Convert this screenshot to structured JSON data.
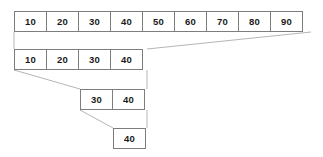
{
  "diagram": {
    "colors": {
      "border": "#7d7d7d",
      "cell_background": "#ffffff",
      "text": "#1a1a1a",
      "connector": "#b5b5b5",
      "page_background": "#ffffff"
    },
    "geometry": {
      "cell_width": 33,
      "cell_height": 21,
      "left_origin_x": 14,
      "right_edge_x": 147
    },
    "rows": [
      {
        "id": "row-1",
        "label": "full-array",
        "x": 14,
        "y": 11,
        "values": [
          "10",
          "20",
          "30",
          "40",
          "50",
          "60",
          "70",
          "80",
          "90"
        ]
      },
      {
        "id": "row-2",
        "label": "first-half",
        "x": 14,
        "y": 49,
        "values": [
          "10",
          "20",
          "30",
          "40"
        ]
      },
      {
        "id": "row-3",
        "label": "second-quarter",
        "x": 80,
        "y": 89,
        "values": [
          "30",
          "40"
        ]
      },
      {
        "id": "row-4",
        "label": "single-element",
        "x": 113,
        "y": 128,
        "values": [
          "40"
        ]
      }
    ],
    "connectors": [
      {
        "id": "c1-left",
        "x1": 14,
        "y1": 32,
        "x2": 14,
        "y2": 49
      },
      {
        "id": "c1-right",
        "x1": 311,
        "y1": 32,
        "x2": 147,
        "y2": 49
      },
      {
        "id": "c2-left",
        "x1": 14,
        "y1": 70,
        "x2": 80,
        "y2": 89
      },
      {
        "id": "c2-right",
        "x1": 147,
        "y1": 70,
        "x2": 147,
        "y2": 89
      },
      {
        "id": "c3-left",
        "x1": 80,
        "y1": 110,
        "x2": 113,
        "y2": 128
      },
      {
        "id": "c3-right",
        "x1": 147,
        "y1": 110,
        "x2": 147,
        "y2": 128
      }
    ]
  }
}
